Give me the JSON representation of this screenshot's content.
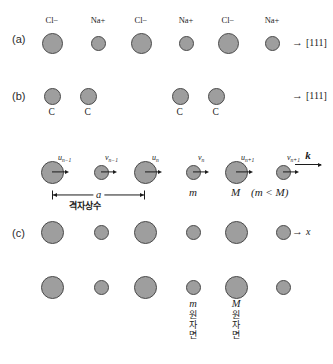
{
  "figure": {
    "row_labels": [
      {
        "text": "(a)",
        "x": 12,
        "y": 33
      },
      {
        "text": "(b)",
        "x": 12,
        "y": 90
      },
      {
        "text": "(c)",
        "x": 12,
        "y": 227
      }
    ],
    "row_a": {
      "direction_arrow": "→",
      "direction_text": "[111]",
      "ion_labels": [
        "Cl−",
        "Na+",
        "Cl−",
        "Na+",
        "Cl−",
        "Na+"
      ],
      "ions": [
        {
          "species": "Cl",
          "charge": "−",
          "cx": 52,
          "cy": 43,
          "r": 10.5
        },
        {
          "species": "Na",
          "charge": "+",
          "cx": 98,
          "cy": 43,
          "r": 7.5
        },
        {
          "species": "Cl",
          "charge": "−",
          "cx": 141,
          "cy": 43,
          "r": 10.5
        },
        {
          "species": "Na",
          "charge": "+",
          "cx": 186,
          "cy": 43,
          "r": 7.5
        },
        {
          "species": "Cl",
          "charge": "−",
          "cx": 228,
          "cy": 43,
          "r": 10.5
        },
        {
          "species": "Na",
          "charge": "+",
          "cx": 272,
          "cy": 43,
          "r": 7.5
        }
      ]
    },
    "row_b": {
      "direction_arrow": "→",
      "direction_text": "[111]",
      "atom_label": "C",
      "atoms": [
        {
          "cx": 52,
          "cy": 96,
          "r": 8.5
        },
        {
          "cx": 88,
          "cy": 96,
          "r": 8.5
        },
        {
          "cx": 180,
          "cy": 96,
          "r": 8.5
        },
        {
          "cx": 216,
          "cy": 96,
          "r": 8.5
        }
      ]
    },
    "row_vib": {
      "wavevector_symbol": "k",
      "lattice_constant_symbol": "a",
      "lattice_constant_korean": "격자상수",
      "mass_small": "m",
      "mass_large": "M",
      "mass_inequality": "(m < M)",
      "displacement_labels": [
        {
          "base": "u",
          "sub": "n−1"
        },
        {
          "base": "v",
          "sub": "n−1"
        },
        {
          "base": "u",
          "sub": "n"
        },
        {
          "base": "v",
          "sub": "n"
        },
        {
          "base": "u",
          "sub": "n+1"
        },
        {
          "base": "v",
          "sub": "n+1"
        }
      ],
      "atoms": [
        {
          "cx": 52,
          "cy": 172,
          "r": 11.5,
          "kind": "M"
        },
        {
          "cx": 101,
          "cy": 172,
          "r": 7.5,
          "kind": "m"
        },
        {
          "cx": 145,
          "cy": 172,
          "r": 11.5,
          "kind": "M"
        },
        {
          "cx": 193,
          "cy": 172,
          "r": 7.5,
          "kind": "m"
        },
        {
          "cx": 236,
          "cy": 172,
          "r": 11.5,
          "kind": "M"
        },
        {
          "cx": 283,
          "cy": 172,
          "r": 7.5,
          "kind": "m"
        }
      ]
    },
    "row_c": {
      "direction_arrow": "→",
      "direction_text": "x",
      "atoms": [
        {
          "cx": 52,
          "cy": 232,
          "r": 11.5,
          "kind": "M"
        },
        {
          "cx": 101,
          "cy": 232,
          "r": 7.5,
          "kind": "m"
        },
        {
          "cx": 145,
          "cy": 232,
          "r": 11.5,
          "kind": "M"
        },
        {
          "cx": 193,
          "cy": 232,
          "r": 7.5,
          "kind": "m"
        },
        {
          "cx": 236,
          "cy": 232,
          "r": 11.5,
          "kind": "M"
        },
        {
          "cx": 283,
          "cy": 232,
          "r": 7.5,
          "kind": "m"
        }
      ]
    },
    "row_d": {
      "atoms": [
        {
          "cx": 52,
          "cy": 287,
          "r": 11.5,
          "kind": "M"
        },
        {
          "cx": 101,
          "cy": 287,
          "r": 7.5,
          "kind": "m"
        },
        {
          "cx": 145,
          "cy": 287,
          "r": 11.5,
          "kind": "M"
        },
        {
          "cx": 193,
          "cy": 287,
          "r": 7.5,
          "kind": "m"
        },
        {
          "cx": 236,
          "cy": 287,
          "r": 11.5,
          "kind": "M"
        },
        {
          "cx": 283,
          "cy": 287,
          "r": 7.5,
          "kind": "m"
        }
      ],
      "plane_small": {
        "symbol": "m",
        "chars": [
          "원",
          "자",
          "면"
        ]
      },
      "plane_large": {
        "symbol": "M",
        "chars": [
          "원",
          "자",
          "면"
        ]
      }
    },
    "colors": {
      "atom_fill": "#9e9e9e",
      "atom_stroke": "#4a4a4a",
      "ink": "#1c1c1c",
      "background": "#ffffff"
    }
  }
}
